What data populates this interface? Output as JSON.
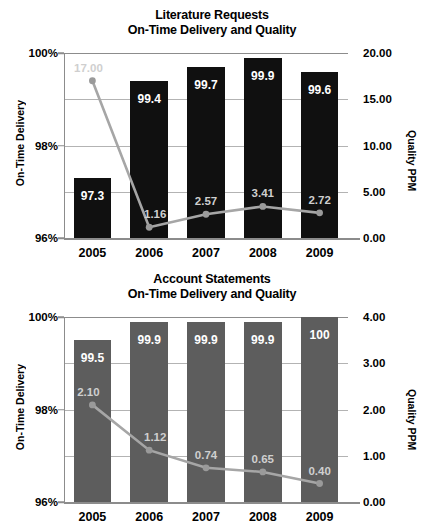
{
  "chart_data": [
    {
      "type": "bar",
      "id": "literature-requests",
      "title": "Literature Requests",
      "subtitle": "On-Time Delivery and Quality",
      "categories": [
        "2005",
        "2006",
        "2007",
        "2008",
        "2009"
      ],
      "xlabel": "",
      "ylabel": "On-Time Delivery",
      "y2label": "Quality PPM",
      "ylim": [
        96,
        100
      ],
      "y2lim": [
        0,
        20
      ],
      "yticks": [
        "96%",
        "98%",
        "100%"
      ],
      "ytick_values": [
        96,
        98,
        100
      ],
      "y2ticks": [
        "0.00",
        "5.00",
        "10.00",
        "15.00",
        "20.00"
      ],
      "y2tick_values": [
        0,
        5,
        10,
        15,
        20
      ],
      "grid": true,
      "legend": "none",
      "series": [
        {
          "name": "On-Time Delivery",
          "kind": "bar",
          "axis": "left",
          "color": "#101010",
          "values": [
            97.3,
            99.4,
            99.7,
            99.9,
            99.6
          ],
          "labels": [
            "97.3",
            "99.4",
            "99.7",
            "99.9",
            "99.6"
          ]
        },
        {
          "name": "Quality PPM",
          "kind": "line",
          "axis": "right",
          "color": "#a6a6a6",
          "values": [
            17.0,
            1.16,
            2.57,
            3.41,
            2.72
          ],
          "labels": [
            "17.00",
            "1.16",
            "2.57",
            "3.41",
            "2.72"
          ]
        }
      ]
    },
    {
      "type": "bar",
      "id": "account-statements",
      "title": "Account Statements",
      "subtitle": "On-Time Delivery and Quality",
      "categories": [
        "2005",
        "2006",
        "2007",
        "2008",
        "2009"
      ],
      "xlabel": "",
      "ylabel": "On-Time Delivery",
      "y2label": "Quality PPM",
      "ylim": [
        96,
        100
      ],
      "y2lim": [
        0,
        4
      ],
      "yticks": [
        "96%",
        "98%",
        "100%"
      ],
      "ytick_values": [
        96,
        98,
        100
      ],
      "y2ticks": [
        "0.00",
        "1.00",
        "2.00",
        "3.00",
        "4.00"
      ],
      "y2tick_values": [
        0,
        1,
        2,
        3,
        4
      ],
      "grid": true,
      "legend": "none",
      "series": [
        {
          "name": "On-Time Delivery",
          "kind": "bar",
          "axis": "left",
          "color": "#5d5d5d",
          "values": [
            99.5,
            99.9,
            99.9,
            99.9,
            100
          ],
          "labels": [
            "99.5",
            "99.9",
            "99.9",
            "99.9",
            "100"
          ]
        },
        {
          "name": "Quality PPM",
          "kind": "line",
          "axis": "right",
          "color": "#a6a6a6",
          "values": [
            2.1,
            1.12,
            0.74,
            0.65,
            0.4
          ],
          "labels": [
            "2.10",
            "1.12",
            "0.74",
            "0.65",
            "0.40"
          ]
        }
      ]
    }
  ]
}
